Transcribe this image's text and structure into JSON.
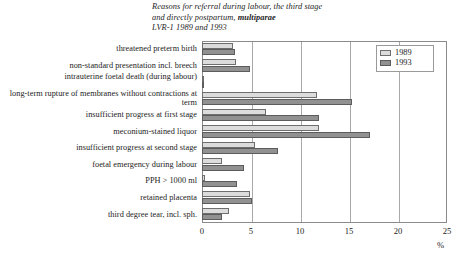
{
  "chart_data": {
    "type": "bar",
    "orientation": "horizontal",
    "title_lines": [
      "Reasons for referral during labour, the third stage",
      "and directly postpartum, ",
      "LVR-1 1989 and 1993"
    ],
    "title_bold_word": "multiparae",
    "title": "Reasons for referral during labour, the third stage and directly postpartum, multiparae LVR-1 1989 and 1993",
    "xlabel": "%",
    "ylabel": "",
    "xlim": [
      0,
      25
    ],
    "xticks": [
      0,
      5,
      10,
      15,
      20,
      25
    ],
    "xtick_labels": [
      "0",
      "5",
      "10",
      "15",
      "20",
      "25"
    ],
    "grid": true,
    "legend_position": "top-right",
    "categories": [
      "threatened preterm birth",
      "non-standard presentation incl. breech",
      "intrauterine foetal death (during labour)",
      "long-term rupture of membranes without contractions at term",
      "insufficient progress at first stage",
      "meconium-stained liquor",
      "insufficient progress at second stage",
      "foetal emergency during labour",
      "PPH > 1000 ml",
      "retained placenta",
      "third degree tear, incl. sph."
    ],
    "series": [
      {
        "name": "1989",
        "color": "#dcdcdc",
        "values": [
          3.2,
          3.5,
          0.2,
          11.7,
          6.5,
          11.9,
          5.4,
          2.0,
          0.3,
          4.9,
          2.8
        ]
      },
      {
        "name": "1993",
        "color": "#919191",
        "values": [
          3.4,
          4.9,
          0.2,
          15.3,
          11.9,
          17.1,
          7.8,
          4.3,
          3.6,
          5.1,
          2.0
        ]
      }
    ]
  },
  "legend": {
    "entries": [
      {
        "label": "1989",
        "swatch": "light-gray-swatch"
      },
      {
        "label": "1993",
        "swatch": "dark-gray-swatch"
      }
    ]
  }
}
